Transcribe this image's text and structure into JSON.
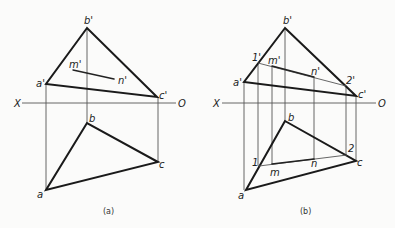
{
  "panels": [
    {
      "caption": "(a)",
      "axis": {
        "left": "X",
        "right": "O"
      },
      "labels": {
        "b_prime": "b'",
        "a_prime": "a'",
        "c_prime": "c'",
        "m_prime": "m'",
        "n_prime": "n'",
        "b": "b",
        "a": "a",
        "c": "c"
      }
    },
    {
      "caption": "(b)",
      "axis": {
        "left": "X",
        "right": "O"
      },
      "labels": {
        "b_prime": "b'",
        "a_prime": "a'",
        "c_prime": "c'",
        "one_prime": "1'",
        "m_prime": "m'",
        "n_prime": "n'",
        "two_prime": "2'",
        "b": "b",
        "a": "a",
        "c": "c",
        "one": "1",
        "m": "m",
        "n": "n",
        "two": "2"
      }
    }
  ]
}
